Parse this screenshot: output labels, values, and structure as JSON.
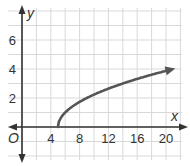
{
  "chart_data": {
    "type": "line",
    "title": "",
    "xlabel": "x",
    "ylabel": "y",
    "origin_label": "O",
    "xlim": [
      -2,
      22
    ],
    "ylim": [
      -2,
      7.5
    ],
    "x_ticks": [
      4,
      8,
      12,
      16,
      20
    ],
    "y_ticks": [
      2,
      4,
      6
    ],
    "grid": true,
    "grid_x_step": 2,
    "grid_y_step": 1,
    "function": "y = sqrt(x - 5)",
    "series": [
      {
        "name": "y = sqrt(x - 5)",
        "x": [
          5,
          6,
          7,
          9,
          11,
          13,
          15,
          17,
          19,
          21
        ],
        "y": [
          0,
          1,
          1.41,
          2,
          2.45,
          2.83,
          3.16,
          3.46,
          3.74,
          4
        ],
        "start_point": [
          5,
          0
        ],
        "end_arrow": true
      }
    ],
    "colors": {
      "curve": "#555555",
      "axis": "#333333",
      "grid": "#d9d9d9"
    }
  }
}
